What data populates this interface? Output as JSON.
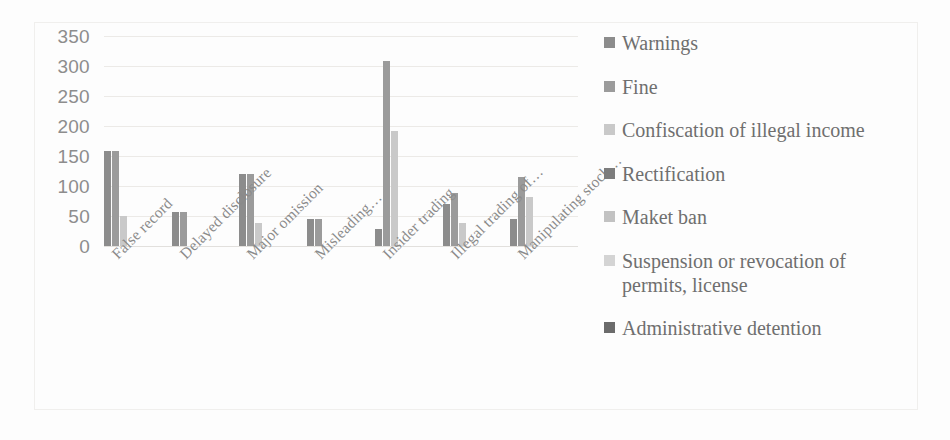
{
  "chart_data": {
    "type": "bar",
    "title": "",
    "subtitle": "",
    "xlabel": "",
    "ylabel": "",
    "ylim": [
      0,
      350
    ],
    "ytick_values": [
      350,
      300,
      250,
      200,
      150,
      100,
      50,
      0
    ],
    "ytick_labels": [
      "350",
      "300",
      "250",
      "200",
      "150",
      "100",
      "50",
      "0"
    ],
    "grid": true,
    "legend_position": "right",
    "categories": [
      "False record",
      "Delayed disclosure",
      "Major omission",
      "Misleading…",
      "Insider trading",
      "Illegal trading of…",
      "Manipulating stock…"
    ],
    "series": [
      {
        "name": "Warnings",
        "color": "#8c8c8c",
        "values": [
          158,
          57,
          120,
          45,
          28,
          70,
          45
        ]
      },
      {
        "name": "Fine",
        "color": "#9b9b9b",
        "values": [
          158,
          57,
          120,
          45,
          308,
          88,
          115
        ]
      },
      {
        "name": "Confiscation of illegal income",
        "color": "#c9c9c9",
        "values": [
          50,
          0,
          38,
          0,
          192,
          38,
          82
        ]
      },
      {
        "name": "Rectification",
        "color": "#7d7d7d",
        "values": [
          0,
          0,
          0,
          0,
          0,
          0,
          0
        ]
      },
      {
        "name": "Maket ban",
        "color": "#c2c2c2",
        "values": [
          0,
          0,
          0,
          0,
          0,
          0,
          0
        ]
      },
      {
        "name": "Suspension or revocation of permits, license",
        "color": "#d4d4d4",
        "values": [
          0,
          0,
          0,
          0,
          0,
          0,
          0
        ]
      },
      {
        "name": "Administrative detention",
        "color": "#6b6b6b",
        "values": [
          0,
          0,
          0,
          0,
          0,
          0,
          0
        ]
      }
    ]
  },
  "legend": {
    "items": [
      {
        "label": "Warnings",
        "color": "#8c8c8c"
      },
      {
        "label": "Fine",
        "color": "#9b9b9b"
      },
      {
        "label": "Confiscation of illegal income",
        "color": "#c9c9c9"
      },
      {
        "label": "Rectification",
        "color": "#7d7d7d"
      },
      {
        "label": "Maket ban",
        "color": "#c2c2c2"
      },
      {
        "label": "Suspension or revocation of permits, license",
        "color": "#d4d4d4"
      },
      {
        "label": "Administrative detention",
        "color": "#6b6b6b"
      }
    ]
  }
}
